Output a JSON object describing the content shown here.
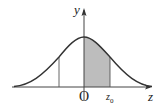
{
  "diagram": {
    "type": "normal-distribution-curve",
    "labels": {
      "y_axis": "y",
      "x_axis": "z",
      "origin": "O",
      "z0_main": "z",
      "z0_sub": "0"
    },
    "colors": {
      "curve": "#333333",
      "axes": "#444444",
      "shaded_region": "#bdbdbd",
      "background": "#ffffff"
    },
    "shaded_region": {
      "from": "O",
      "to": "z0"
    },
    "marker_lines": [
      "-z0 (left vertical line)",
      "z0 (right boundary)"
    ]
  }
}
